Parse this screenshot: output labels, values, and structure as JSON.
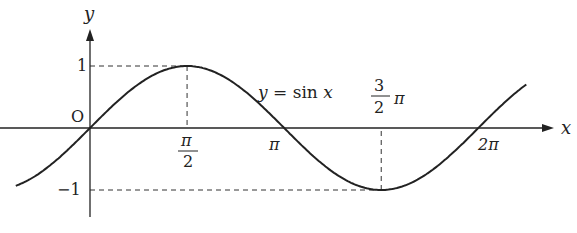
{
  "chart_data": {
    "type": "line",
    "title": "",
    "function_label": "y = sin x",
    "xlabel": "x",
    "ylabel": "y",
    "origin_label": "O",
    "x_ticks": [
      {
        "value": 1.5708,
        "label_num": "π",
        "label_den": "2"
      },
      {
        "value": 3.1416,
        "label": "π"
      },
      {
        "value": 4.7124,
        "label_num": "3",
        "label_den": "2",
        "label_suffix": "π"
      },
      {
        "value": 6.2832,
        "label": "2π"
      }
    ],
    "y_ticks": [
      {
        "value": 1,
        "label": "1"
      },
      {
        "value": -1,
        "label": "−1"
      }
    ],
    "xlim": [
      -1.2,
      7.2
    ],
    "ylim": [
      -1.3,
      1.6
    ],
    "series": [
      {
        "name": "sin x",
        "function": "sin",
        "x_range": [
          -1.2,
          7.06
        ]
      }
    ],
    "reference_lines": [
      {
        "type": "dashed",
        "from": [
          0,
          1
        ],
        "to": [
          1.5708,
          1
        ]
      },
      {
        "type": "dashed",
        "from": [
          1.5708,
          1
        ],
        "to": [
          1.5708,
          0
        ]
      },
      {
        "type": "dashed",
        "from": [
          0,
          -1
        ],
        "to": [
          4.7124,
          -1
        ]
      },
      {
        "type": "dashed",
        "from": [
          4.7124,
          -1
        ],
        "to": [
          4.7124,
          0
        ]
      }
    ],
    "grid": false,
    "legend": "none"
  }
}
